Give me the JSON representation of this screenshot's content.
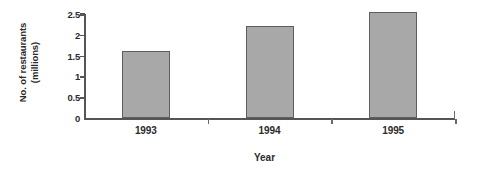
{
  "chart_data": {
    "type": "bar",
    "title": "",
    "subtitle": "",
    "categories": [
      "1993",
      "1994",
      "1995"
    ],
    "values": [
      1.6,
      2.2,
      2.55
    ],
    "xlabel": "Year",
    "ylabel": "No. of restaurants (millions)",
    "ylabel_lines": [
      "No. of restaurants",
      "(millions)"
    ],
    "ylim": [
      0,
      2.5
    ],
    "ytick_labels": [
      "0",
      "0.5",
      "1",
      "1.5",
      "2",
      "2.5"
    ],
    "ytick_values": [
      0,
      0.5,
      1,
      1.5,
      2,
      2.5
    ],
    "grid": false,
    "legend": false,
    "legend_position": "none",
    "bar_fill_color": "#a8a8a8",
    "bar_border_color": "#5e5e5e",
    "axis_color": "#555555",
    "text_color": "#2b2b2b",
    "background_color": "#ffffff"
  }
}
